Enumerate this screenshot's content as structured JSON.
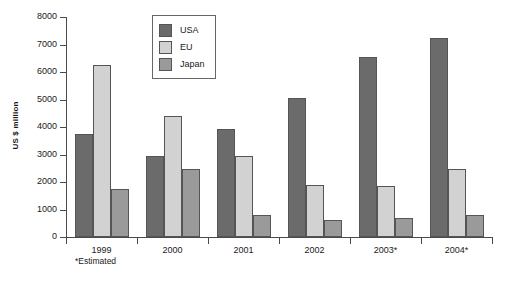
{
  "chart_data": {
    "type": "bar",
    "title": "",
    "xlabel": "",
    "ylabel": "US $ million",
    "ylim": [
      0,
      8000
    ],
    "ytick_labels": [
      "8000",
      "7000",
      "6000",
      "5000",
      "4000",
      "3000",
      "2000",
      "1000",
      "0"
    ],
    "ytick_values": [
      8000,
      7000,
      6000,
      5000,
      4000,
      3000,
      2000,
      1000,
      0
    ],
    "grid": false,
    "legend_position": "top-center",
    "categories": [
      "1999",
      "2000",
      "2001",
      "2002",
      "2003*",
      "2004*"
    ],
    "series": [
      {
        "name": "USA",
        "color": "#6b6b6b",
        "values": [
          3730,
          2950,
          3920,
          5050,
          6550,
          7250
        ]
      },
      {
        "name": "EU",
        "color": "#d2d2d2",
        "values": [
          6270,
          4400,
          2950,
          1900,
          1850,
          2480
        ]
      },
      {
        "name": "Japan",
        "color": "#9a9a9a",
        "values": [
          1750,
          2470,
          800,
          620,
          690,
          790
        ]
      }
    ],
    "annotations": [
      "*Estimated"
    ]
  },
  "footnote": "*Estimated",
  "legend": {
    "items": [
      {
        "label": "USA"
      },
      {
        "label": "EU"
      },
      {
        "label": "Japan"
      }
    ]
  }
}
